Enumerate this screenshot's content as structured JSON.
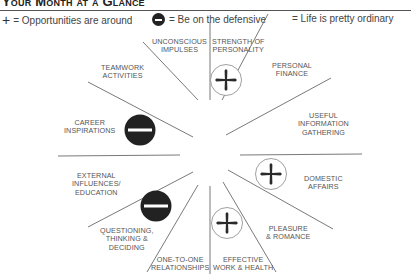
{
  "header": {
    "title": "Your Month at a Glance"
  },
  "legend": [
    {
      "icon": "cross-plus-icon",
      "text": "= Opportunities are around"
    },
    {
      "icon": "minus-circle-icon",
      "text": "= Be on the defensive"
    },
    {
      "icon": "none",
      "text": "= Life is pretty ordinary"
    }
  ],
  "wheel": {
    "sectors": [
      {
        "id": "strength",
        "label_lines": [
          "STRENGTH OF",
          "PERSONALITY"
        ],
        "status": "opportunity"
      },
      {
        "id": "finance",
        "label_lines": [
          "PERSONAL",
          "FINANCE"
        ],
        "status": "ordinary"
      },
      {
        "id": "info",
        "label_lines": [
          "USEFUL",
          "INFORMATION",
          "GATHERING"
        ],
        "status": "ordinary"
      },
      {
        "id": "domestic",
        "label_lines": [
          "DOMESTIC",
          "AFFAIRS"
        ],
        "status": "opportunity"
      },
      {
        "id": "pleasure",
        "label_lines": [
          "PLEASURE",
          "& ROMANCE"
        ],
        "status": "ordinary"
      },
      {
        "id": "work",
        "label_lines": [
          "EFFECTIVE",
          "WORK & HEALTH"
        ],
        "status": "opportunity"
      },
      {
        "id": "relationships",
        "label_lines": [
          "ONE-TO-ONE",
          "RELATIONSHIPS"
        ],
        "status": "ordinary"
      },
      {
        "id": "questioning",
        "label_lines": [
          "QUESTIONING,",
          "THINKING &",
          "DECIDING"
        ],
        "status": "defensive"
      },
      {
        "id": "external",
        "label_lines": [
          "EXTERNAL",
          "INFLUENCES/",
          "EDUCATION"
        ],
        "status": "ordinary"
      },
      {
        "id": "career",
        "label_lines": [
          "CAREER",
          "INSPIRATIONS"
        ],
        "status": "defensive"
      },
      {
        "id": "teamwork",
        "label_lines": [
          "TEAMWORK",
          "ACTIVITIES"
        ],
        "status": "ordinary"
      },
      {
        "id": "unconscious",
        "label_lines": [
          "UNCONSCIOUS",
          "IMPULSES"
        ],
        "status": "ordinary"
      }
    ]
  },
  "colors": {
    "line": "#666666",
    "defensive_fill": "#222222",
    "text": "#555555"
  }
}
